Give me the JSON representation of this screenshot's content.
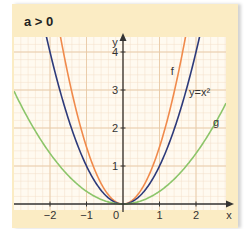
{
  "title": "a > 0",
  "colors": {
    "panel": "#fbecc4",
    "grid_bg": "#fffaf0",
    "grid_minor": "#f3dfc8",
    "grid_major": "#e8c9a6",
    "axis": "#333333",
    "f": "#f08a4b",
    "parabola": "#2d3a7a",
    "g": "#8cc56a"
  },
  "chart_data": {
    "type": "line",
    "title": "a > 0",
    "xlabel": "x",
    "ylabel": "y",
    "xlim": [
      -3.0,
      2.85
    ],
    "ylim": [
      -0.1,
      4.4
    ],
    "grid": true,
    "x_ticks": [
      -2,
      -1,
      0,
      1,
      2
    ],
    "y_ticks": [
      1,
      2,
      3,
      4
    ],
    "series": [
      {
        "name": "f",
        "label": "f",
        "formula": "y = 1.5x^2",
        "a": 1.5,
        "color": "#f08a4b"
      },
      {
        "name": "y = x²",
        "label": "y=x²",
        "formula": "y = x^2",
        "a": 1,
        "color": "#2d3a7a"
      },
      {
        "name": "g",
        "label": "g",
        "formula": "y = x^2/3",
        "a": 0.333,
        "color": "#8cc56a"
      }
    ],
    "annotations": [
      {
        "text": "f",
        "x": 1.35,
        "y": 3.4
      },
      {
        "text": "y=x²",
        "x": 2.1,
        "y": 2.85
      },
      {
        "text": "g",
        "x": 2.55,
        "y": 2.05
      }
    ]
  },
  "axis": {
    "x_label": "x",
    "y_label": "y",
    "origin_label": "0"
  }
}
